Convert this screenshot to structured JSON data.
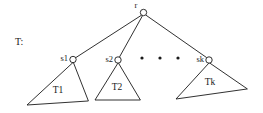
{
  "figure": {
    "name": "tree-decomposition-diagram",
    "label": "T:",
    "label_x": 15,
    "label_y": 45,
    "background_color": "#ffffff",
    "ink_color": "#1a1a1a",
    "width": 263,
    "height": 113
  },
  "root": {
    "id": "r",
    "label": "r",
    "cx": 143.5,
    "cy": 12.5,
    "radius": 3.2,
    "label_x": 136,
    "label_y": 8
  },
  "children": [
    {
      "id": "s1",
      "label": "s1",
      "cx": 73,
      "cy": 59.5,
      "radius": 3.2,
      "label_x": 68,
      "label_y": 61,
      "subtree": {
        "label": "T1",
        "label_x": 58,
        "label_y": 93,
        "apex_x": 73,
        "apex_y": 62.5,
        "left_x": 27,
        "left_y": 105,
        "right_x": 88,
        "right_y": 101
      }
    },
    {
      "id": "s2",
      "label": "s2",
      "cx": 118,
      "cy": 60,
      "radius": 3.2,
      "label_x": 113,
      "label_y": 61.5,
      "subtree": {
        "label": "T2",
        "label_x": 117,
        "label_y": 90,
        "apex_x": 118,
        "apex_y": 63,
        "left_x": 95,
        "left_y": 100,
        "right_x": 140,
        "right_y": 100
      }
    },
    {
      "id": "sk",
      "label": "sk",
      "cx": 209,
      "cy": 60,
      "radius": 3.2,
      "label_x": 204,
      "label_y": 61.5,
      "subtree": {
        "label": "Tk",
        "label_x": 210,
        "label_y": 85,
        "apex_x": 209,
        "apex_y": 63,
        "left_x": 176,
        "left_y": 99,
        "right_x": 247,
        "right_y": 89
      }
    }
  ],
  "edges": [
    {
      "name": "edge-root-to-s1",
      "x1": 141.5,
      "x2": 76,
      "y1": 15.2,
      "y2": 57.5
    },
    {
      "name": "edge-root-to-s2",
      "x1": 142.5,
      "x2": 119.5,
      "y1": 15.7,
      "y2": 57
    },
    {
      "name": "edge-root-to-sk",
      "x1": 146,
      "x2": 206.5,
      "y1": 15.2,
      "y2": 57.5
    }
  ],
  "ellipsis": {
    "name": "ellipsis-between-subtrees",
    "radius": 1.6,
    "dots": [
      {
        "cx": 142,
        "cy": 58
      },
      {
        "cx": 160,
        "cy": 58
      },
      {
        "cx": 178,
        "cy": 58
      }
    ]
  },
  "chart_data": {
    "type": "diagram",
    "diagram_kind": "rooted-tree",
    "title": "T:",
    "nodes": [
      "r",
      "s1",
      "s2",
      "sk"
    ],
    "subtrees": [
      "T1",
      "T2",
      "Tk"
    ],
    "edges": [
      [
        "r",
        "s1"
      ],
      [
        "r",
        "s2"
      ],
      [
        "r",
        "sk"
      ]
    ],
    "ellipsis_count": 3
  }
}
